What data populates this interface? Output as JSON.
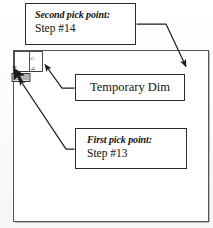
{
  "figure": {
    "kind": "cad-tutorial-annotated-screenshot",
    "ink_color": "#2b2b2b",
    "paper_color": "#fdfdfc"
  },
  "drawing_area": {
    "name": "cad-drawing-frame",
    "border_color": "#4a4a4a"
  },
  "sketch": {
    "name": "temporary-dimension-sketch",
    "rectangle_label": "",
    "dimension_text_vertical": "b",
    "dimension_text_small": "h",
    "cursor_label": "pick-cursor"
  },
  "callouts": [
    {
      "id": "second-pick-point",
      "emphasis": "Second pick point:",
      "detail": "Step #14"
    },
    {
      "id": "temporary-dim",
      "emphasis": "",
      "detail": "Temporary Dim"
    },
    {
      "id": "first-pick-point",
      "emphasis": "First pick point:",
      "detail": "Step #13"
    }
  ],
  "arrows": [
    {
      "id": "arrow-second-pick",
      "from": "second-pick-point-callout",
      "to": "drawing-frame-interior"
    },
    {
      "id": "arrow-temporary-dim",
      "from": "temporary-dim-callout",
      "to": "dimension-witness-line"
    },
    {
      "id": "arrow-first-pick",
      "from": "first-pick-point-callout",
      "to": "sketch-corner-pick"
    }
  ]
}
